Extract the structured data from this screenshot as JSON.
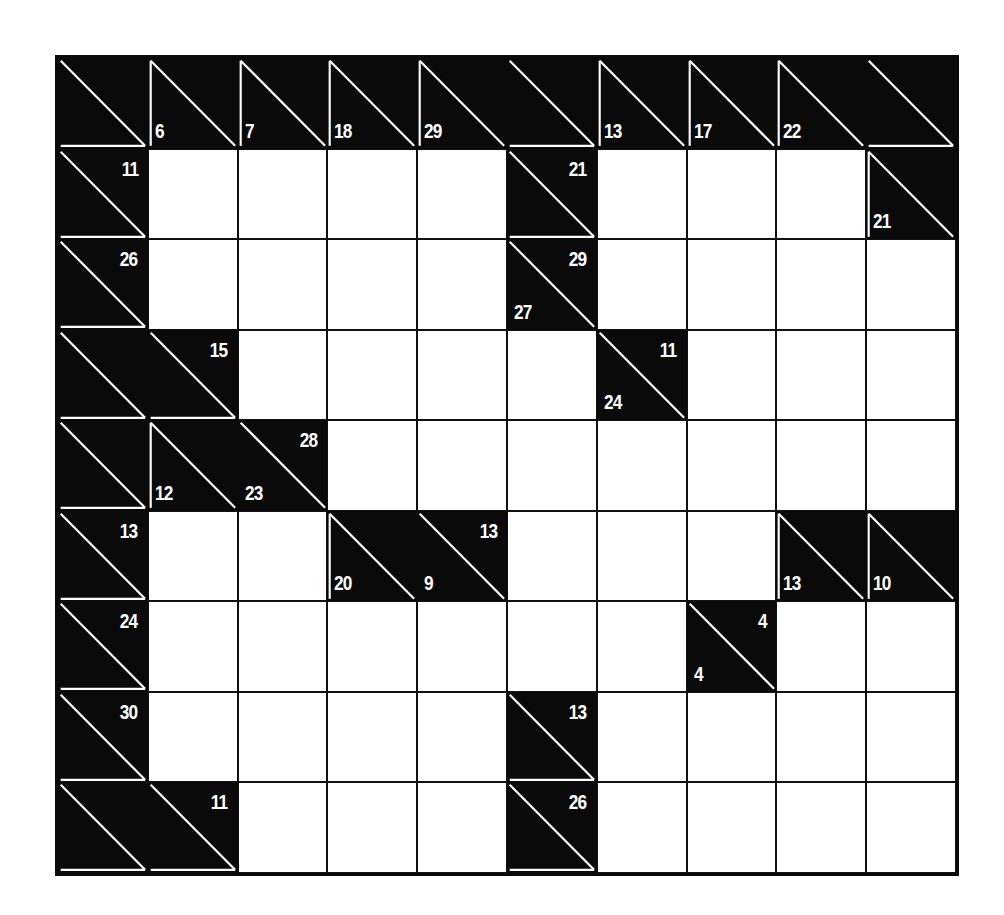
{
  "puzzle": {
    "type": "kakuro",
    "rows": 9,
    "cols": 10,
    "colors": {
      "block": "#0a0a0a",
      "blank": "#ffffff",
      "clue_text": "#ffffff",
      "divider": "#ffffff"
    },
    "grid": [
      [
        {
          "t": "clue"
        },
        {
          "t": "clue",
          "down": "6"
        },
        {
          "t": "clue",
          "down": "7"
        },
        {
          "t": "clue",
          "down": "18"
        },
        {
          "t": "clue",
          "down": "29"
        },
        {
          "t": "clue"
        },
        {
          "t": "clue",
          "down": "13"
        },
        {
          "t": "clue",
          "down": "17"
        },
        {
          "t": "clue",
          "down": "22"
        },
        {
          "t": "clue"
        }
      ],
      [
        {
          "t": "clue",
          "across": "11"
        },
        {
          "t": "white"
        },
        {
          "t": "white"
        },
        {
          "t": "white"
        },
        {
          "t": "white"
        },
        {
          "t": "clue",
          "across": "21"
        },
        {
          "t": "white"
        },
        {
          "t": "white"
        },
        {
          "t": "white"
        },
        {
          "t": "clue",
          "down": "21"
        }
      ],
      [
        {
          "t": "clue",
          "across": "26"
        },
        {
          "t": "white"
        },
        {
          "t": "white"
        },
        {
          "t": "white"
        },
        {
          "t": "white"
        },
        {
          "t": "clue",
          "down": "27",
          "across": "29"
        },
        {
          "t": "white"
        },
        {
          "t": "white"
        },
        {
          "t": "white"
        },
        {
          "t": "white"
        }
      ],
      [
        {
          "t": "clue"
        },
        {
          "t": "clue",
          "across": "15"
        },
        {
          "t": "white"
        },
        {
          "t": "white"
        },
        {
          "t": "white"
        },
        {
          "t": "white"
        },
        {
          "t": "clue",
          "down": "24",
          "across": "11"
        },
        {
          "t": "white"
        },
        {
          "t": "white"
        },
        {
          "t": "white"
        }
      ],
      [
        {
          "t": "clue"
        },
        {
          "t": "clue",
          "down": "12"
        },
        {
          "t": "clue",
          "down": "23",
          "across": "28"
        },
        {
          "t": "white"
        },
        {
          "t": "white"
        },
        {
          "t": "white"
        },
        {
          "t": "white"
        },
        {
          "t": "white"
        },
        {
          "t": "white"
        },
        {
          "t": "white"
        }
      ],
      [
        {
          "t": "clue",
          "across": "13"
        },
        {
          "t": "white"
        },
        {
          "t": "white"
        },
        {
          "t": "clue",
          "down": "20"
        },
        {
          "t": "clue",
          "down": "9",
          "across": "13"
        },
        {
          "t": "white"
        },
        {
          "t": "white"
        },
        {
          "t": "white"
        },
        {
          "t": "clue",
          "down": "13"
        },
        {
          "t": "clue",
          "down": "10"
        }
      ],
      [
        {
          "t": "clue",
          "across": "24"
        },
        {
          "t": "white"
        },
        {
          "t": "white"
        },
        {
          "t": "white"
        },
        {
          "t": "white"
        },
        {
          "t": "white"
        },
        {
          "t": "white"
        },
        {
          "t": "clue",
          "down": "4",
          "across": "4"
        },
        {
          "t": "white"
        },
        {
          "t": "white"
        }
      ],
      [
        {
          "t": "clue",
          "across": "30"
        },
        {
          "t": "white"
        },
        {
          "t": "white"
        },
        {
          "t": "white"
        },
        {
          "t": "white"
        },
        {
          "t": "clue",
          "across": "13"
        },
        {
          "t": "white"
        },
        {
          "t": "white"
        },
        {
          "t": "white"
        },
        {
          "t": "white"
        }
      ],
      [
        {
          "t": "clue"
        },
        {
          "t": "clue",
          "across": "11"
        },
        {
          "t": "white"
        },
        {
          "t": "white"
        },
        {
          "t": "white"
        },
        {
          "t": "clue",
          "across": "26"
        },
        {
          "t": "white"
        },
        {
          "t": "white"
        },
        {
          "t": "white"
        },
        {
          "t": "white"
        }
      ]
    ]
  }
}
